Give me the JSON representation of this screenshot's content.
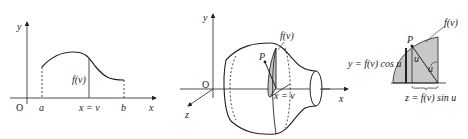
{
  "panels": {
    "curve": {
      "y_axis": "y",
      "x_axis": "x",
      "origin": "O",
      "a": "a",
      "b": "b",
      "xv": "x = v",
      "fv": "f(v)"
    },
    "solid": {
      "y_axis": "y",
      "z_axis": "z",
      "origin": "O",
      "point": "P",
      "fv": "f(v)",
      "xv": "x = v"
    },
    "cross_section": {
      "point": "P",
      "fv": "f(v)",
      "u1": "u",
      "u2": "u",
      "x_axis": "x",
      "y_eq": "y = f(v) cos u",
      "z_eq": "z = f(v) sin u"
    }
  },
  "colors": {
    "shade": "#c8c8c8",
    "line": "#222222"
  }
}
